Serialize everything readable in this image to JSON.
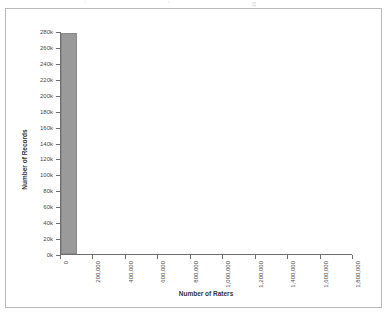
{
  "figure": {
    "background_color": "#ffffff",
    "border_color": "#b9b9b9",
    "axis_color": "#6e6e6e"
  },
  "top_artifacts": [
    "'",
    "'",
    "g"
  ],
  "chart_data": {
    "type": "bar",
    "title": "",
    "subtitle": "",
    "xlabel": "Number of Raters",
    "ylabel": "Number of Records",
    "grid": false,
    "legend": false,
    "legend_position": "none",
    "bar_color": "#9a9a9a",
    "bar_edge_color": "#8a8a8a",
    "xlim": [
      0,
      1800000
    ],
    "ylim": [
      0,
      280000
    ],
    "xtick_labels": [
      "0",
      "200,000",
      "400,000",
      "600,000",
      "800,000",
      "1,000,000",
      "1,200,000",
      "1,400,000",
      "1,600,000",
      "1,800,000"
    ],
    "xtick_values": [
      0,
      200000,
      400000,
      600000,
      800000,
      1000000,
      1200000,
      1400000,
      1600000,
      1800000
    ],
    "ytick_labels": [
      "0k",
      "20k",
      "40k",
      "60k",
      "80k",
      "100k",
      "120k",
      "140k",
      "160k",
      "180k",
      "200k",
      "220k",
      "240k",
      "260k",
      "280k"
    ],
    "ytick_values": [
      0,
      20000,
      40000,
      60000,
      80000,
      100000,
      120000,
      140000,
      160000,
      180000,
      200000,
      220000,
      240000,
      260000,
      280000
    ],
    "bins": [
      {
        "x_start": 0,
        "x_end": 100000,
        "value": 277000
      }
    ],
    "categories": [
      "0"
    ],
    "values": [
      277000
    ],
    "annotations": []
  }
}
